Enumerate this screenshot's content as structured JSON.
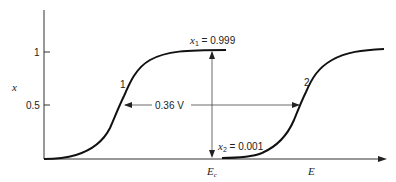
{
  "diagram": {
    "y_axis": {
      "label": "x",
      "ticks": [
        {
          "value": "1",
          "y": 51
        },
        {
          "value": "0.5",
          "y": 105
        }
      ]
    },
    "x_axis": {
      "label": "E",
      "marker_label": "E",
      "marker_subscript": "c"
    },
    "curves": [
      {
        "id": "1",
        "label": "1"
      },
      {
        "id": "2",
        "label": "2"
      }
    ],
    "annotations": {
      "x1_label": "x",
      "x1_sub": "1",
      "x1_value": " = 0.999",
      "x2_label": "x",
      "x2_sub": "2",
      "x2_value": " = 0.001",
      "separation": "0.36 V"
    },
    "colors": {
      "line": "#111111",
      "axis": "#333333"
    }
  }
}
